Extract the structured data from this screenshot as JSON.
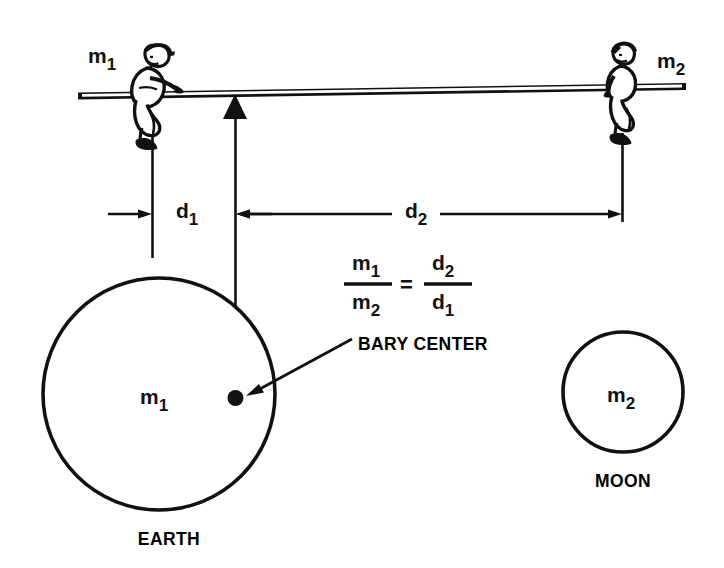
{
  "figure": {
    "title_present": false,
    "background_color": "#ffffff",
    "ink_color": "#111111"
  },
  "labels": {
    "mass_left": {
      "base": "m",
      "sub": "1"
    },
    "mass_right": {
      "base": "m",
      "sub": "2"
    },
    "mass_earth": {
      "base": "m",
      "sub": "1"
    },
    "mass_moon": {
      "base": "m",
      "sub": "2"
    },
    "distance_left": {
      "base": "d",
      "sub": "1"
    },
    "distance_right": {
      "base": "d",
      "sub": "2"
    },
    "barycenter": "BARY CENTER",
    "earth": "EARTH",
    "moon": "MOON"
  },
  "equation": {
    "numerator_left": {
      "base": "m",
      "sub": "1"
    },
    "denominator_left": {
      "base": "m",
      "sub": "2"
    },
    "operator": "=",
    "numerator_right": {
      "base": "d",
      "sub": "2"
    },
    "denominator_right": {
      "base": "d",
      "sub": "1"
    },
    "plain_text": "m1 / m2 = d2 / d1"
  },
  "elements": {
    "plank": "seesaw-plank",
    "fulcrum": "fulcrum-triangle",
    "person_left": "seated-person-left",
    "person_right": "seated-person-right",
    "earth_circle": "earth-circle",
    "moon_circle": "moon-circle",
    "barycenter_dot": "barycenter-dot"
  }
}
